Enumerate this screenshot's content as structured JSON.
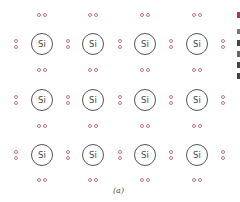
{
  "diagram": {
    "atom_label": "Si",
    "grid": {
      "rows": 3,
      "cols": 4
    },
    "atoms": [
      {
        "row": 0,
        "col": 0,
        "label": "Si",
        "x": 42,
        "y": 44
      },
      {
        "row": 0,
        "col": 1,
        "label": "Si",
        "x": 93,
        "y": 44
      },
      {
        "row": 0,
        "col": 2,
        "label": "Si",
        "x": 145,
        "y": 44
      },
      {
        "row": 0,
        "col": 3,
        "label": "Si",
        "x": 197,
        "y": 44
      },
      {
        "row": 1,
        "col": 0,
        "label": "Si",
        "x": 42,
        "y": 100
      },
      {
        "row": 1,
        "col": 1,
        "label": "Si",
        "x": 93,
        "y": 100
      },
      {
        "row": 1,
        "col": 2,
        "label": "Si",
        "x": 145,
        "y": 100
      },
      {
        "row": 1,
        "col": 3,
        "label": "Si",
        "x": 197,
        "y": 100
      },
      {
        "row": 2,
        "col": 0,
        "label": "Si",
        "x": 42,
        "y": 155
      },
      {
        "row": 2,
        "col": 1,
        "label": "Si",
        "x": 93,
        "y": 155
      },
      {
        "row": 2,
        "col": 2,
        "label": "Si",
        "x": 145,
        "y": 155
      },
      {
        "row": 2,
        "col": 3,
        "label": "Si",
        "x": 197,
        "y": 155
      }
    ],
    "electron_pair_rows_y": [
      15,
      70,
      126,
      180
    ],
    "electron_pair_cols_x": [
      16,
      68,
      120,
      171,
      223
    ],
    "colors": {
      "electron": "#b87a82",
      "atom_border": "#555555",
      "text": "#444444",
      "edge_accent": "#c0304a"
    },
    "caption": "(a)"
  }
}
